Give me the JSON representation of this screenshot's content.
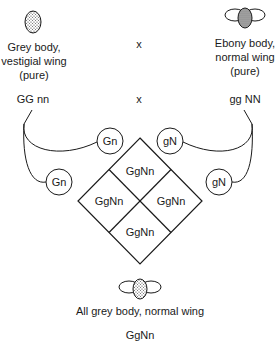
{
  "parents": {
    "left": {
      "label_line1": "Grey body,",
      "label_line2": "vestigial wing",
      "label_line3": "(pure)",
      "genotype": "GG nn",
      "gametes": [
        "Gn",
        "Gn"
      ],
      "icon": "grey-fly-vestigial-wing-icon"
    },
    "cross_symbol_1": "x",
    "cross_symbol_2": "x",
    "right": {
      "label_line1": "Ebony body,",
      "label_line2": "normal wing",
      "label_line3": "(pure)",
      "genotype": "gg NN",
      "gametes": [
        "gN",
        "gN"
      ],
      "icon": "ebony-fly-normal-wing-icon"
    }
  },
  "punnett": {
    "cells": [
      "GgNn",
      "GgNn",
      "GgNn",
      "GgNn"
    ]
  },
  "offspring": {
    "label": "All grey body, normal wing",
    "genotype": "GgNn",
    "icon": "grey-fly-normal-wing-icon"
  },
  "colors": {
    "line": "#1a1a1a",
    "grey_fill": "#c8c8c8",
    "ebony_fill": "#9a9a9a"
  }
}
